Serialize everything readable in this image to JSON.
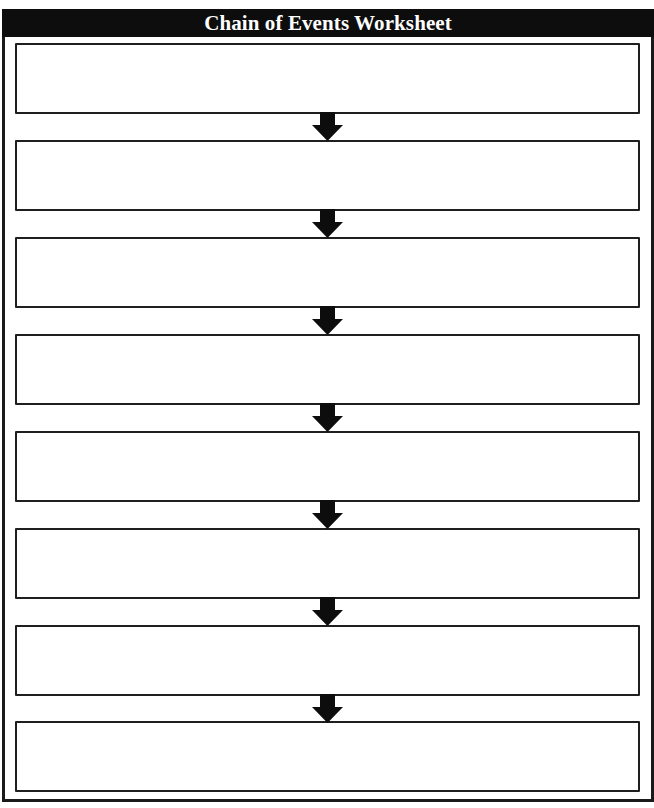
{
  "worksheet": {
    "title": "Chain of Events Worksheet",
    "boxes": [
      {
        "index": 1,
        "content": ""
      },
      {
        "index": 2,
        "content": ""
      },
      {
        "index": 3,
        "content": ""
      },
      {
        "index": 4,
        "content": ""
      },
      {
        "index": 5,
        "content": ""
      },
      {
        "index": 6,
        "content": ""
      },
      {
        "index": 7,
        "content": ""
      },
      {
        "index": 8,
        "content": ""
      }
    ],
    "arrow_icon": "down-arrow-icon",
    "colors": {
      "header_bg": "#0d0d0d",
      "header_text": "#ffffff",
      "border": "#1f1f1f",
      "arrow": "#0d0d0d"
    }
  }
}
